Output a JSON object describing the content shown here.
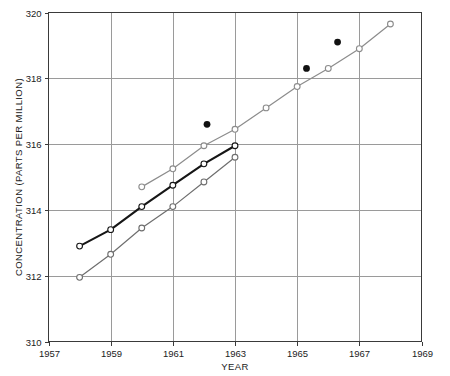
{
  "chart_data": {
    "type": "line",
    "title": "",
    "xlabel": "YEAR",
    "ylabel": "CONCENTRATION (PARTS PER MILLION)",
    "xlim": [
      1957,
      1969
    ],
    "ylim": [
      310,
      320
    ],
    "xticks": [
      1957,
      1959,
      1961,
      1963,
      1965,
      1967,
      1969
    ],
    "yticks": [
      310,
      312,
      314,
      316,
      318,
      320
    ],
    "grid": true,
    "legend": "none",
    "series": [
      {
        "name": "upper-gray-series",
        "color": "#8c8c8c",
        "marker": "open-circle",
        "x": [
          1960.0,
          1961.0,
          1962.0,
          1963.0,
          1964.0,
          1965.0,
          1966.0,
          1967.0,
          1968.0
        ],
        "y": [
          314.7,
          315.25,
          315.95,
          316.45,
          317.1,
          317.75,
          318.3,
          318.9,
          319.65
        ]
      },
      {
        "name": "black-series",
        "color": "#161616",
        "marker": "open-circle",
        "x": [
          1958.0,
          1959.0,
          1960.0,
          1961.0,
          1962.0,
          1963.0
        ],
        "y": [
          312.9,
          313.4,
          314.1,
          314.75,
          315.4,
          315.95
        ]
      },
      {
        "name": "lower-gray-series",
        "color": "#6e6e6e",
        "marker": "open-circle",
        "x": [
          1958.0,
          1959.0,
          1960.0,
          1961.0,
          1962.0,
          1963.0
        ],
        "y": [
          311.95,
          312.65,
          313.45,
          314.1,
          314.85,
          315.6
        ]
      },
      {
        "name": "filled-dot-series",
        "color": "#111111",
        "marker": "filled-circle",
        "x": [
          1962.1,
          1965.3,
          1966.3
        ],
        "y": [
          316.6,
          318.3,
          319.1
        ]
      }
    ]
  },
  "axes": {
    "x_tick_labels": [
      "1957",
      "1959",
      "1961",
      "1963",
      "1965",
      "1967",
      "1969"
    ],
    "y_tick_labels": [
      "310",
      "312",
      "314",
      "316",
      "318",
      "320"
    ],
    "x_axis_title": "YEAR",
    "y_axis_title": "CONCENTRATION (PARTS PER MILLION)"
  }
}
